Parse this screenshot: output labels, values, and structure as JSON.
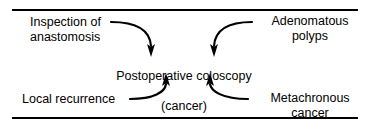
{
  "figure": {
    "type": "concept-diagram",
    "border_color": "#000000",
    "text_color": "#000000",
    "background": "#ffffff"
  },
  "center_node": {
    "line1": "Postoperative coloscopy",
    "line2": "(cancer)"
  },
  "sources": [
    {
      "id": "inspection",
      "text": "Inspection of\nanastomosis",
      "position": "top-left"
    },
    {
      "id": "adenomatous",
      "text": "Adenomatous\npolyps",
      "position": "top-right"
    },
    {
      "id": "local",
      "text": "Local recurrence",
      "position": "bottom-left"
    },
    {
      "id": "metachronous",
      "text": "Metachronous\ncancer",
      "position": "bottom-right"
    }
  ],
  "arrows": [
    {
      "id": "arrow-inspection-to-center",
      "from": "inspection",
      "to": "center_node",
      "style": "curved",
      "head": "down"
    },
    {
      "id": "arrow-adenomatous-to-center",
      "from": "adenomatous",
      "to": "center_node",
      "style": "curved",
      "head": "down"
    },
    {
      "id": "arrow-local-to-center",
      "from": "local",
      "to": "center_node",
      "style": "curved",
      "head": "up"
    },
    {
      "id": "arrow-metachronous-to-center",
      "from": "metachronous",
      "to": "center_node",
      "style": "curved",
      "head": "up"
    }
  ]
}
